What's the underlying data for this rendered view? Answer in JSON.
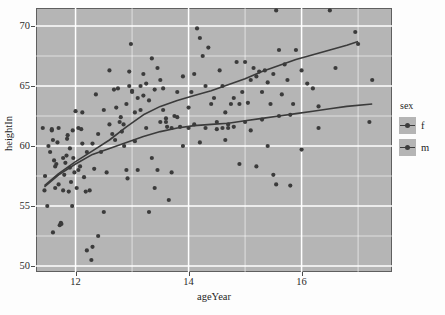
{
  "plot": {
    "x_axis_title": "ageYear",
    "y_axis_title": "heightIn",
    "panel_bg_color": "#b5b5b5",
    "grid_color": "#ffffff",
    "point_color": "#3b3b3b",
    "line_color": "#3b3b3b"
  },
  "legend": {
    "title": "sex",
    "items": [
      {
        "label": "f",
        "key_name": "legend-key-f"
      },
      {
        "label": "m",
        "key_name": "legend-key-m"
      }
    ]
  },
  "chart_data": {
    "type": "scatter",
    "title": "",
    "xlabel": "ageYear",
    "ylabel": "heightIn",
    "xlim": [
      11.3,
      17.6
    ],
    "ylim": [
      49.5,
      71.5
    ],
    "xticks": [
      12,
      14,
      16
    ],
    "yticks": [
      50,
      55,
      60,
      65,
      70
    ],
    "xminorticks": [
      13,
      15,
      17
    ],
    "yminorticks": [
      52.5,
      57.5,
      62.5,
      67.5
    ],
    "grid": true,
    "legend": {
      "title": "sex",
      "position": "right",
      "entries": [
        "f",
        "m"
      ]
    },
    "series": [
      {
        "name": "f",
        "marker": "circle",
        "color": "#3b3b3b",
        "points": [
          [
            11.42,
            61.5
          ],
          [
            11.45,
            56.3
          ],
          [
            11.46,
            57.5
          ],
          [
            11.5,
            55.0
          ],
          [
            11.52,
            60.0
          ],
          [
            11.55,
            59.5
          ],
          [
            11.58,
            61.3
          ],
          [
            11.6,
            52.8
          ],
          [
            11.62,
            58.8
          ],
          [
            11.64,
            56.5
          ],
          [
            11.66,
            58.5
          ],
          [
            11.68,
            60.3
          ],
          [
            11.7,
            56.8
          ],
          [
            11.72,
            53.4
          ],
          [
            11.74,
            53.6
          ],
          [
            11.75,
            53.5
          ],
          [
            11.78,
            56.3
          ],
          [
            11.8,
            57.6
          ],
          [
            11.82,
            58.6
          ],
          [
            11.84,
            59.2
          ],
          [
            11.86,
            60.9
          ],
          [
            11.88,
            56.2
          ],
          [
            11.9,
            58.2
          ],
          [
            11.92,
            57.0
          ],
          [
            11.94,
            55.0
          ],
          [
            11.96,
            59.0
          ],
          [
            11.98,
            57.8
          ],
          [
            12.0,
            62.9
          ],
          [
            12.02,
            56.5
          ],
          [
            12.05,
            58.0
          ],
          [
            12.08,
            58.3
          ],
          [
            12.1,
            61.4
          ],
          [
            12.12,
            60.2
          ],
          [
            12.15,
            57.4
          ],
          [
            12.18,
            56.2
          ],
          [
            12.2,
            51.3
          ],
          [
            12.25,
            56.3
          ],
          [
            12.28,
            50.5
          ],
          [
            12.3,
            51.6
          ],
          [
            12.33,
            58.1
          ],
          [
            12.36,
            64.3
          ],
          [
            12.4,
            52.5
          ],
          [
            12.45,
            59.5
          ],
          [
            12.5,
            54.5
          ],
          [
            12.55,
            57.8
          ],
          [
            12.6,
            66.3
          ],
          [
            12.65,
            61.0
          ],
          [
            12.7,
            60.5
          ],
          [
            12.75,
            64.8
          ],
          [
            12.78,
            62.0
          ],
          [
            12.82,
            61.2
          ],
          [
            12.86,
            60.0
          ],
          [
            12.9,
            58.0
          ],
          [
            12.92,
            57.3
          ],
          [
            12.95,
            66.2
          ],
          [
            12.98,
            68.5
          ],
          [
            13.0,
            64.5
          ],
          [
            13.05,
            60.4
          ],
          [
            13.1,
            58.0
          ],
          [
            13.15,
            63.0
          ],
          [
            13.2,
            64.2
          ],
          [
            13.25,
            61.5
          ],
          [
            13.3,
            54.5
          ],
          [
            13.35,
            59.0
          ],
          [
            13.4,
            56.5
          ],
          [
            13.45,
            58.0
          ],
          [
            13.5,
            65.5
          ],
          [
            13.55,
            64.8
          ],
          [
            13.6,
            62.0
          ],
          [
            13.62,
            61.6
          ],
          [
            13.65,
            55.5
          ],
          [
            13.7,
            57.8
          ],
          [
            13.8,
            62.4
          ],
          [
            13.85,
            61.6
          ],
          [
            13.9,
            60.0
          ],
          [
            14.0,
            61.5
          ],
          [
            14.1,
            61.8
          ],
          [
            14.2,
            60.3
          ],
          [
            14.3,
            61.5
          ],
          [
            14.5,
            61.4
          ],
          [
            14.6,
            61.5
          ],
          [
            14.65,
            60.5
          ],
          [
            14.7,
            61.8
          ],
          [
            14.8,
            61.6
          ],
          [
            14.9,
            58.5
          ],
          [
            15.0,
            62.0
          ],
          [
            15.1,
            61.3
          ],
          [
            15.2,
            58.3
          ],
          [
            15.3,
            62.2
          ],
          [
            15.4,
            60.0
          ],
          [
            15.5,
            57.6
          ],
          [
            15.55,
            56.8
          ],
          [
            15.6,
            62.5
          ],
          [
            15.8,
            56.7
          ],
          [
            16.0,
            59.7
          ],
          [
            16.3,
            61.5
          ],
          [
            16.6,
            66.5
          ],
          [
            17.2,
            62.0
          ],
          [
            17.25,
            65.5
          ]
        ]
      },
      {
        "name": "m",
        "marker": "circle",
        "color": "#3b3b3b",
        "points": [
          [
            11.58,
            61.4
          ],
          [
            11.6,
            60.5
          ],
          [
            11.64,
            58.3
          ],
          [
            11.7,
            61.5
          ],
          [
            11.78,
            59.0
          ],
          [
            11.85,
            60.6
          ],
          [
            11.9,
            59.8
          ],
          [
            11.95,
            61.3
          ],
          [
            12.05,
            61.5
          ],
          [
            12.12,
            62.8
          ],
          [
            12.2,
            59.5
          ],
          [
            12.3,
            60.2
          ],
          [
            12.4,
            61.0
          ],
          [
            12.5,
            63.0
          ],
          [
            12.6,
            61.8
          ],
          [
            12.68,
            64.7
          ],
          [
            12.72,
            63.2
          ],
          [
            12.8,
            62.4
          ],
          [
            12.85,
            61.8
          ],
          [
            12.9,
            63.5
          ],
          [
            12.95,
            65.0
          ],
          [
            13.0,
            64.6
          ],
          [
            13.05,
            62.8
          ],
          [
            13.1,
            64.0
          ],
          [
            13.15,
            65.0
          ],
          [
            13.2,
            66.0
          ],
          [
            13.25,
            65.2
          ],
          [
            13.3,
            63.8
          ],
          [
            13.35,
            67.3
          ],
          [
            13.4,
            64.7
          ],
          [
            13.45,
            66.5
          ],
          [
            13.5,
            62.0
          ],
          [
            13.55,
            63.0
          ],
          [
            13.6,
            62.3
          ],
          [
            13.7,
            61.5
          ],
          [
            13.75,
            62.5
          ],
          [
            13.8,
            64.5
          ],
          [
            13.9,
            65.8
          ],
          [
            14.0,
            63.2
          ],
          [
            14.05,
            64.5
          ],
          [
            14.1,
            66.0
          ],
          [
            14.15,
            69.8
          ],
          [
            14.2,
            69.0
          ],
          [
            14.25,
            67.5
          ],
          [
            14.3,
            65.0
          ],
          [
            14.35,
            68.2
          ],
          [
            14.4,
            63.5
          ],
          [
            14.45,
            64.0
          ],
          [
            14.5,
            62.0
          ],
          [
            14.55,
            66.3
          ],
          [
            14.6,
            65.0
          ],
          [
            14.65,
            62.8
          ],
          [
            14.7,
            61.5
          ],
          [
            14.75,
            63.5
          ],
          [
            14.8,
            64.0
          ],
          [
            14.85,
            67.0
          ],
          [
            14.9,
            63.5
          ],
          [
            14.95,
            64.5
          ],
          [
            15.0,
            67.0
          ],
          [
            15.05,
            63.6
          ],
          [
            15.1,
            65.5
          ],
          [
            15.15,
            66.5
          ],
          [
            15.2,
            65.8
          ],
          [
            15.25,
            66.2
          ],
          [
            15.3,
            64.5
          ],
          [
            15.35,
            66.3
          ],
          [
            15.4,
            65.3
          ],
          [
            15.45,
            63.5
          ],
          [
            15.5,
            66.0
          ],
          [
            15.55,
            71.3
          ],
          [
            15.6,
            68.0
          ],
          [
            15.65,
            64.3
          ],
          [
            15.7,
            66.8
          ],
          [
            15.75,
            65.5
          ],
          [
            15.8,
            62.6
          ],
          [
            15.85,
            63.5
          ],
          [
            15.9,
            68.0
          ],
          [
            16.0,
            66.3
          ],
          [
            16.1,
            65.2
          ],
          [
            16.2,
            64.8
          ],
          [
            16.3,
            63.3
          ],
          [
            16.5,
            71.3
          ],
          [
            16.95,
            69.5
          ],
          [
            17.0,
            68.5
          ]
        ]
      }
    ],
    "smooth_lines": [
      {
        "name": "f",
        "description": "loess smooth for females, flatter curve",
        "points": [
          [
            11.45,
            56.6
          ],
          [
            11.7,
            57.6
          ],
          [
            12.0,
            58.5
          ],
          [
            12.3,
            59.3
          ],
          [
            12.6,
            59.8
          ],
          [
            12.9,
            60.3
          ],
          [
            13.2,
            60.8
          ],
          [
            13.5,
            61.2
          ],
          [
            13.8,
            61.5
          ],
          [
            14.1,
            61.7
          ],
          [
            14.4,
            61.8
          ],
          [
            14.7,
            61.9
          ],
          [
            15.0,
            62.1
          ],
          [
            15.3,
            62.3
          ],
          [
            15.6,
            62.5
          ],
          [
            15.9,
            62.7
          ],
          [
            16.2,
            62.9
          ],
          [
            16.5,
            63.1
          ],
          [
            16.8,
            63.3
          ],
          [
            17.25,
            63.5
          ]
        ]
      },
      {
        "name": "m",
        "description": "loess smooth for males, steeper rising curve",
        "points": [
          [
            11.45,
            56.7
          ],
          [
            11.7,
            57.7
          ],
          [
            12.0,
            58.7
          ],
          [
            12.3,
            59.6
          ],
          [
            12.6,
            60.5
          ],
          [
            12.9,
            61.6
          ],
          [
            13.2,
            62.6
          ],
          [
            13.5,
            63.3
          ],
          [
            13.8,
            63.8
          ],
          [
            14.1,
            64.2
          ],
          [
            14.4,
            64.6
          ],
          [
            14.7,
            65.1
          ],
          [
            15.0,
            65.6
          ],
          [
            15.3,
            66.2
          ],
          [
            15.6,
            66.7
          ],
          [
            15.9,
            67.2
          ],
          [
            16.2,
            67.6
          ],
          [
            16.5,
            68.0
          ],
          [
            16.8,
            68.4
          ],
          [
            17.0,
            68.7
          ]
        ]
      }
    ]
  }
}
